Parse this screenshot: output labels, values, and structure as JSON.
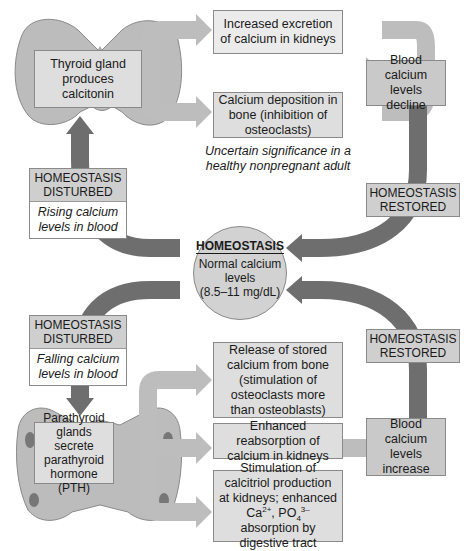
{
  "diagram": {
    "colors": {
      "dark_arrow": "#6e6e6e",
      "light_arrow": "#bdbdbd",
      "box_light": "#ebebeb",
      "box_dark": "#c9c9c9",
      "center_circle": "#d2d2d2"
    },
    "center": {
      "title": "HOMEOSTASIS",
      "text_line1": "Normal calcium",
      "text_line2": "levels",
      "text_line3": "(8.5–11 mg/dL)"
    },
    "upper_loop": {
      "gland_label": "Thyroid gland produces calcitonin",
      "effects": [
        {
          "label": "Increased excretion of calcium in kidneys"
        },
        {
          "label": "Calcium deposition in bone (inhibition of osteoclasts)"
        }
      ],
      "note": "Uncertain significance in a healthy nonpregnant adult",
      "result": "Blood calcium levels decline",
      "disturbed": {
        "header_line1": "HOMEOSTASIS",
        "header_line2": "DISTURBED",
        "detail": "Rising calcium levels in blood"
      },
      "restored": {
        "line1": "HOMEOSTASIS",
        "line2": "RESTORED"
      }
    },
    "lower_loop": {
      "gland_label": "Parathyroid glands secrete parathyroid hormone (PTH)",
      "effects": [
        {
          "label": "Release of stored calcium from bone (stimulation of osteoclasts more than osteoblasts)"
        },
        {
          "label": "Enhanced reabsorption of calcium in kidneys"
        },
        {
          "label_part1": "Stimulation of calcitriol production at kidneys; enhanced Ca",
          "sup1": "2+",
          "label_part2": ", PO",
          "sub2": "4",
          "sup2": "3–",
          "label_part3": " absorption by digestive tract"
        }
      ],
      "result": "Blood calcium levels increase",
      "disturbed": {
        "header_line1": "HOMEOSTASIS",
        "header_line2": "DISTURBED",
        "detail": "Falling calcium levels in blood"
      },
      "restored": {
        "line1": "HOMEOSTASIS",
        "line2": "RESTORED"
      }
    }
  }
}
